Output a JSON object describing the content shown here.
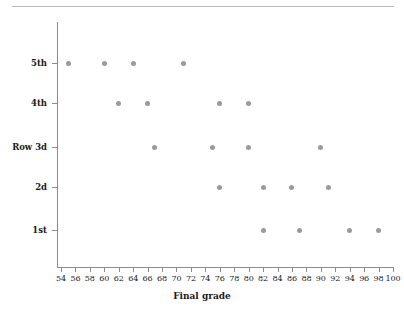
{
  "chart_data": {
    "type": "scatter",
    "title": "",
    "subtitle": "",
    "xlabel": "Final grade",
    "ylabel": "",
    "xlim": [
      53,
      101
    ],
    "grid": false,
    "legend": false,
    "marker_color": "#9a9a9a",
    "axis_color": "#8c8c8c",
    "x_ticks": [
      54,
      56,
      58,
      60,
      62,
      64,
      66,
      68,
      70,
      72,
      74,
      76,
      78,
      80,
      82,
      84,
      86,
      88,
      90,
      92,
      94,
      96,
      98,
      100
    ],
    "x_tick_labels": [
      "54",
      "56",
      "58",
      "60",
      "62",
      "64",
      "66",
      "68",
      "70",
      "72",
      "74",
      "76",
      "78",
      "80",
      "82",
      "84",
      "86",
      "88",
      "90",
      "92",
      "94",
      "96",
      "98",
      "100"
    ],
    "y_categories": [
      "1st",
      "2d",
      "Row 3d",
      "4th",
      "5th"
    ],
    "y_tick_labels": [
      "1st",
      "2d",
      "Row 3d",
      "4th",
      "5th"
    ],
    "series": [
      {
        "name": "1st",
        "category": "1st",
        "values": [
          82,
          87,
          94,
          98
        ]
      },
      {
        "name": "2d",
        "category": "2d",
        "values": [
          76,
          82,
          86,
          91
        ]
      },
      {
        "name": "Row 3d",
        "category": "Row 3d",
        "values": [
          67,
          75,
          80,
          90
        ]
      },
      {
        "name": "4th",
        "category": "4th",
        "values": [
          62,
          66,
          76,
          80
        ]
      },
      {
        "name": "5th",
        "category": "5th",
        "values": [
          55,
          60,
          64,
          71
        ]
      }
    ],
    "points": [
      {
        "row": "5th",
        "grade": 55
      },
      {
        "row": "5th",
        "grade": 60
      },
      {
        "row": "5th",
        "grade": 64
      },
      {
        "row": "5th",
        "grade": 71
      },
      {
        "row": "4th",
        "grade": 62
      },
      {
        "row": "4th",
        "grade": 66
      },
      {
        "row": "4th",
        "grade": 76
      },
      {
        "row": "4th",
        "grade": 80
      },
      {
        "row": "Row 3d",
        "grade": 67
      },
      {
        "row": "Row 3d",
        "grade": 75
      },
      {
        "row": "Row 3d",
        "grade": 80
      },
      {
        "row": "Row 3d",
        "grade": 90
      },
      {
        "row": "2d",
        "grade": 76
      },
      {
        "row": "2d",
        "grade": 82
      },
      {
        "row": "2d",
        "grade": 86
      },
      {
        "row": "2d",
        "grade": 91
      },
      {
        "row": "1st",
        "grade": 82
      },
      {
        "row": "1st",
        "grade": 87
      },
      {
        "row": "1st",
        "grade": 94
      },
      {
        "row": "1st",
        "grade": 98
      }
    ]
  }
}
